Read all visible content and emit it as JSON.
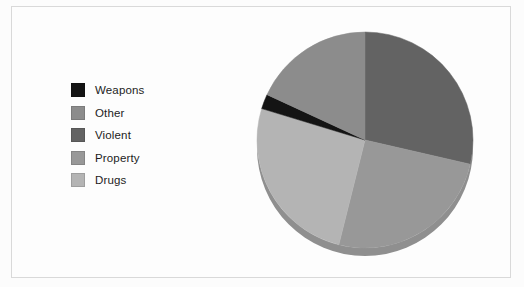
{
  "figure": {
    "background_color": "#fdfdfd",
    "border_color": "#d9d9d9"
  },
  "legend": {
    "position": "left",
    "items": [
      {
        "label": "Weapons",
        "color": "#141414"
      },
      {
        "label": "Other",
        "color": "#8c8c8c"
      },
      {
        "label": "Violent",
        "color": "#636363"
      },
      {
        "label": "Property",
        "color": "#989898"
      },
      {
        "label": "Drugs",
        "color": "#b4b4b4"
      }
    ]
  },
  "chart_data": {
    "type": "pie",
    "title": "",
    "categories": [
      "Violent",
      "Property",
      "Drugs",
      "Weapons",
      "Other"
    ],
    "values": [
      28.6,
      25.3,
      25.8,
      2.2,
      18.1
    ],
    "colors": [
      "#636363",
      "#989898",
      "#b4b4b4",
      "#141414",
      "#8c8c8c"
    ],
    "start_angle_deg": 0,
    "direction": "clockwise",
    "three_d": true,
    "depth_shadow_color": "#8f8f8f",
    "legend_order": [
      "Weapons",
      "Other",
      "Violent",
      "Property",
      "Drugs"
    ],
    "center": {
      "x": 360,
      "y": 140
    },
    "radius": 108,
    "xlabel": "",
    "ylabel": "",
    "grid": false,
    "slice_boundaries_deg": [
      0,
      103,
      194,
      287,
      295,
      360
    ]
  }
}
